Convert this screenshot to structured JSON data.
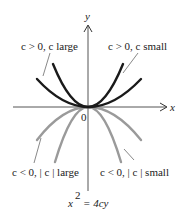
{
  "diagram": {
    "axes": {
      "x_label": "x",
      "y_label": "y",
      "origin_label": "0"
    },
    "curves": [
      {
        "id": "pos-large",
        "label": "c > 0, c large",
        "sign": "c > 0",
        "magnitude": "c large",
        "color": "#1a1a1a"
      },
      {
        "id": "pos-small",
        "label": "c > 0, c small",
        "sign": "c > 0",
        "magnitude": "c small",
        "color": "#1a1a1a"
      },
      {
        "id": "neg-large",
        "label": "c < 0, | c | large",
        "sign": "c < 0",
        "magnitude": "| c | large",
        "color": "#9a9a9a"
      },
      {
        "id": "neg-small",
        "label": "c < 0, | c | small",
        "sign": "c < 0",
        "magnitude": "| c | small",
        "color": "#9a9a9a"
      }
    ],
    "labels": {
      "top_left": "c > 0, c large",
      "top_right": "c > 0, c small",
      "bottom_left": "c < 0, | c | large",
      "bottom_right": "c < 0, | c | small"
    },
    "equation": {
      "lhs_base": "x",
      "lhs_exp": "2",
      "rhs": "= 4cy"
    },
    "colors": {
      "positive_curves": "#1a1a1a",
      "negative_curves": "#9a9a9a",
      "axes": "#333333"
    }
  }
}
